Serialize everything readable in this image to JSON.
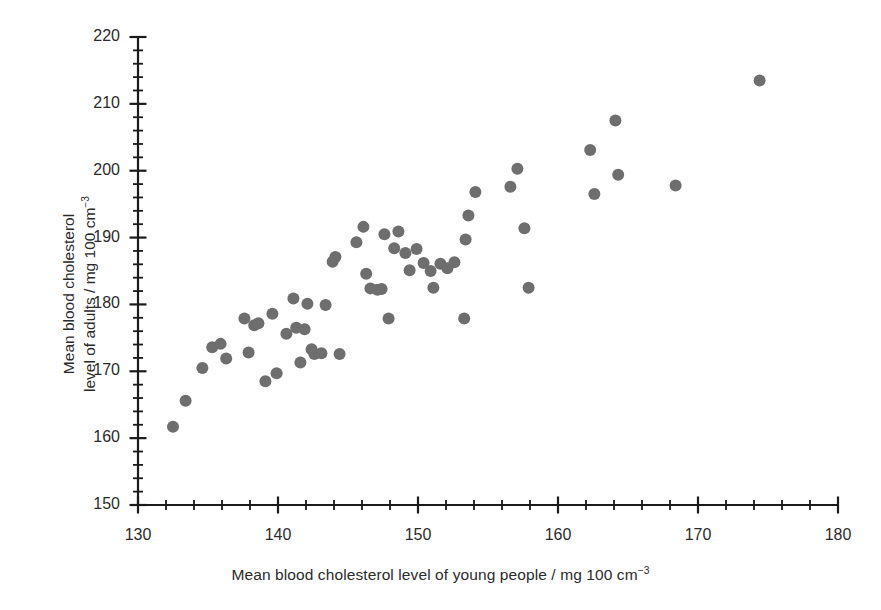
{
  "chart_data": {
    "type": "scatter",
    "title": "",
    "xlabel": "Mean blood cholesterol level of young people / mg 100 cm<sup>−3</sup>",
    "xlabel_text": "Mean blood cholesterol level of young people / mg 100 cm",
    "xlabel_exponent": "−3",
    "ylabel_line1": "Mean blood cholesterol",
    "ylabel_line2_text": "level of adults / mg 100 cm",
    "ylabel_exponent": "−3",
    "xlim": [
      130,
      180
    ],
    "ylim": [
      150,
      220
    ],
    "xticks": [
      130,
      140,
      150,
      160,
      170,
      180
    ],
    "yticks": [
      150,
      160,
      170,
      180,
      190,
      200,
      210,
      220
    ],
    "x_minor_step": 2,
    "y_minor_step": 2,
    "grid": false,
    "legend": null,
    "marker": {
      "shape": "circle",
      "color": "#6e6e6e",
      "radius_px": 6
    },
    "axis_color": "#1b1b1b",
    "points": [
      [
        132.5,
        161.7
      ],
      [
        133.4,
        165.6
      ],
      [
        134.6,
        170.5
      ],
      [
        135.3,
        173.6
      ],
      [
        135.9,
        174.1
      ],
      [
        136.3,
        171.9
      ],
      [
        137.6,
        177.9
      ],
      [
        137.9,
        172.8
      ],
      [
        138.3,
        176.9
      ],
      [
        138.6,
        177.2
      ],
      [
        139.1,
        168.5
      ],
      [
        139.6,
        178.6
      ],
      [
        139.9,
        169.7
      ],
      [
        140.6,
        175.6
      ],
      [
        141.1,
        180.9
      ],
      [
        141.3,
        176.5
      ],
      [
        141.6,
        171.3
      ],
      [
        141.9,
        176.3
      ],
      [
        142.1,
        180.1
      ],
      [
        142.4,
        173.3
      ],
      [
        142.6,
        172.6
      ],
      [
        143.1,
        172.7
      ],
      [
        143.4,
        179.9
      ],
      [
        143.9,
        186.4
      ],
      [
        144.1,
        187.1
      ],
      [
        144.4,
        172.6
      ],
      [
        145.6,
        189.3
      ],
      [
        146.1,
        191.6
      ],
      [
        146.3,
        184.6
      ],
      [
        146.6,
        182.4
      ],
      [
        147.1,
        182.2
      ],
      [
        147.4,
        182.3
      ],
      [
        147.6,
        190.5
      ],
      [
        147.9,
        177.9
      ],
      [
        148.3,
        188.4
      ],
      [
        148.6,
        190.9
      ],
      [
        149.1,
        187.7
      ],
      [
        149.4,
        185.1
      ],
      [
        149.9,
        188.3
      ],
      [
        150.4,
        186.2
      ],
      [
        150.9,
        185.0
      ],
      [
        151.1,
        182.5
      ],
      [
        151.6,
        186.1
      ],
      [
        152.1,
        185.4
      ],
      [
        152.6,
        186.3
      ],
      [
        153.3,
        177.9
      ],
      [
        153.4,
        189.7
      ],
      [
        153.6,
        193.3
      ],
      [
        154.1,
        196.8
      ],
      [
        156.6,
        197.6
      ],
      [
        157.1,
        200.3
      ],
      [
        157.6,
        191.4
      ],
      [
        157.9,
        182.5
      ],
      [
        162.3,
        203.1
      ],
      [
        162.6,
        196.5
      ],
      [
        164.1,
        207.5
      ],
      [
        164.3,
        199.4
      ],
      [
        168.4,
        197.8
      ],
      [
        174.4,
        213.5
      ]
    ]
  }
}
